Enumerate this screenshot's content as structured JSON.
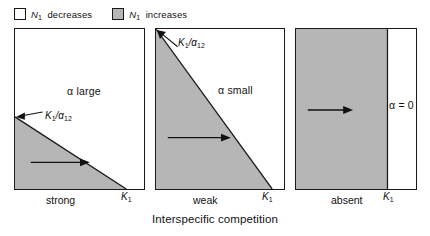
{
  "figure": {
    "caption": "Interspecific competition",
    "width": 430,
    "height": 236
  },
  "legend": {
    "entries": [
      {
        "swatch": "white",
        "symbol": "N",
        "subscript": "1",
        "text": "decreases",
        "color": "#ffffff"
      },
      {
        "swatch": "gray",
        "symbol": "N",
        "subscript": "1",
        "text": "increases",
        "color": "#b6b6b6"
      }
    ]
  },
  "panels": [
    {
      "id": "strong",
      "caption": "strong",
      "alpha_label": "α large",
      "intercept_label": "K",
      "intercept_sub": "1",
      "intercept_denom": "α",
      "intercept_denom_sub": "12",
      "axis_label": "K",
      "axis_sub": "1",
      "shade_fill": "#b6b6b6"
    },
    {
      "id": "weak",
      "caption": "weak",
      "alpha_label": "α small",
      "intercept_label": "K",
      "intercept_sub": "1",
      "intercept_denom": "α",
      "intercept_denom_sub": "12",
      "axis_label": "K",
      "axis_sub": "1",
      "shade_fill": "#b6b6b6"
    },
    {
      "id": "absent",
      "caption": "absent",
      "alpha_label": "α = 0",
      "axis_label": "K",
      "axis_sub": "1",
      "shade_fill": "#b6b6b6"
    }
  ],
  "colors": {
    "shade": "#b6b6b6",
    "line": "#1a1a1a",
    "background": "#ffffff"
  }
}
